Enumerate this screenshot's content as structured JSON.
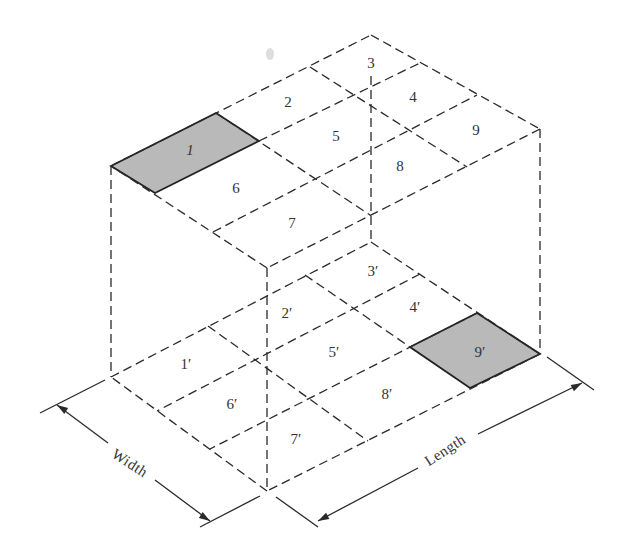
{
  "figure": {
    "top_face": {
      "corners": {
        "back": [
          371,
          35
        ],
        "right": [
          540,
          129
        ],
        "front": [
          267,
          268
        ],
        "left": [
          111,
          166
        ]
      },
      "grid_lines": [
        [
          [
            259,
            141
          ],
          [
            420,
            63
          ]
        ],
        [
          [
            213,
            232
          ],
          [
            477,
            95
          ]
        ],
        [
          [
            216,
            113
          ],
          [
            370,
            215
          ]
        ],
        [
          [
            310,
            67
          ],
          [
            467,
            167
          ]
        ]
      ],
      "shaded_cell": {
        "label": "1",
        "points": [
          [
            111,
            166
          ],
          [
            216,
            113
          ],
          [
            259,
            141
          ],
          [
            155,
            193
          ]
        ]
      },
      "labels": [
        {
          "text": "1",
          "x": 190,
          "y": 150,
          "italic": true
        },
        {
          "text": "2",
          "x": 288,
          "y": 102
        },
        {
          "text": "3",
          "x": 371,
          "y": 63
        },
        {
          "text": "4",
          "x": 413,
          "y": 97
        },
        {
          "text": "5",
          "x": 336,
          "y": 136
        },
        {
          "text": "6",
          "x": 236,
          "y": 188
        },
        {
          "text": "7",
          "x": 292,
          "y": 223
        },
        {
          "text": "8",
          "x": 400,
          "y": 166
        },
        {
          "text": "9",
          "x": 476,
          "y": 130
        }
      ]
    },
    "bottom_face": {
      "corners": {
        "back": [
          371,
          242
        ],
        "right": [
          540,
          354
        ],
        "front": [
          267,
          491
        ],
        "left": [
          111,
          377
        ]
      },
      "grid_lines": [
        [
          [
            208,
            326
          ],
          [
            368,
            441
          ]
        ],
        [
          [
            305,
            275
          ],
          [
            410,
            347
          ]
        ],
        [
          [
            420,
            274
          ],
          [
            157,
            411
          ]
        ],
        [
          [
            477,
            313
          ],
          [
            210,
            449
          ]
        ]
      ],
      "shaded_cell": {
        "label": "9′",
        "points": [
          [
            410,
            347
          ],
          [
            477,
            313
          ],
          [
            540,
            354
          ],
          [
            470,
            388
          ]
        ]
      },
      "labels": [
        {
          "text": "1′",
          "x": 186,
          "y": 364
        },
        {
          "text": "2′",
          "x": 287,
          "y": 313
        },
        {
          "text": "3′",
          "x": 373,
          "y": 271
        },
        {
          "text": "4′",
          "x": 415,
          "y": 307
        },
        {
          "text": "5′",
          "x": 334,
          "y": 352
        },
        {
          "text": "6′",
          "x": 232,
          "y": 404
        },
        {
          "text": "7′",
          "x": 296,
          "y": 439
        },
        {
          "text": "8′",
          "x": 387,
          "y": 394
        },
        {
          "text": "9′",
          "x": 480,
          "y": 352
        }
      ]
    },
    "vertical_edges": [
      [
        [
          111,
          166
        ],
        [
          111,
          377
        ]
      ],
      [
        [
          540,
          129
        ],
        [
          540,
          354
        ]
      ],
      [
        [
          267,
          268
        ],
        [
          267,
          491
        ]
      ],
      [
        [
          371,
          76
        ],
        [
          371,
          242
        ]
      ]
    ],
    "dimensions": {
      "width": {
        "label": "Width",
        "label_pos": [
          130,
          463
        ],
        "angle": 33,
        "extension_lines": [
          [
            [
              105,
              380
            ],
            [
              40,
              413
            ]
          ],
          [
            [
              260,
              496
            ],
            [
              200,
              527
            ]
          ]
        ],
        "segments": [
          [
            [
              57,
              405
            ],
            [
              108,
              443
            ]
          ],
          [
            [
              155,
              480
            ],
            [
              210,
              521
            ]
          ]
        ],
        "arrow_tips": [
          [
            57,
            405,
            213
          ],
          [
            210,
            521,
            33
          ]
        ]
      },
      "length": {
        "label": "Length",
        "label_pos": [
          445,
          450
        ],
        "angle": -33,
        "extension_lines": [
          [
            [
              276,
              497
            ],
            [
              318,
              527
            ]
          ],
          [
            [
              547,
              357
            ],
            [
              594,
              390
            ]
          ]
        ],
        "segments": [
          [
            [
              318,
              521
            ],
            [
              418,
              468
            ]
          ],
          [
            [
              478,
              434
            ],
            [
              582,
              383
            ]
          ]
        ],
        "arrow_tips": [
          [
            318,
            521,
            152
          ],
          [
            582,
            383,
            -28
          ]
        ]
      }
    }
  }
}
